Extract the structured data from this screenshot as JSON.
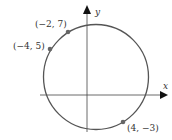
{
  "axes": {
    "x_label": "x",
    "y_label": "y"
  },
  "circle": {
    "center": [
      1,
      2
    ],
    "radius_sq": 34
  },
  "points": [
    {
      "label": "(−2, 7)",
      "x": -2,
      "y": 7
    },
    {
      "label": "(−4, 5)",
      "x": -4,
      "y": 5
    },
    {
      "label": "(4, −3)",
      "x": 4,
      "y": -3
    }
  ]
}
